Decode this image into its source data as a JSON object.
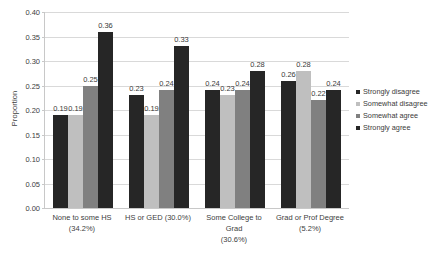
{
  "chart_data": {
    "type": "bar",
    "title": "",
    "xlabel": "",
    "ylabel": "Proportion",
    "ylim": [
      0.0,
      0.4
    ],
    "ytick_step": 0.05,
    "yticks": [
      "0.40",
      "0.35",
      "0.30",
      "0.25",
      "0.20",
      "0.15",
      "0.10",
      "0.05",
      "0.00"
    ],
    "grid": true,
    "legend_position": "right",
    "categories": [
      "None to some HS (34.2%)",
      "HS or GED (30.0%)",
      "Some College to Grad (30.6%)",
      "Grad or Prof Degree (5.2%)"
    ],
    "category_lines": [
      {
        "name": "None to some HS",
        "pct": "(34.2%)"
      },
      {
        "name": "HS or GED (30.0%)",
        "pct": ""
      },
      {
        "name": "Some College to Grad",
        "pct": "(30.6%)"
      },
      {
        "name": "Grad or Prof Degree",
        "pct": "(5.2%)"
      }
    ],
    "series": [
      {
        "name": "Strongly disagree",
        "color": "#262626",
        "values": [
          0.19,
          0.23,
          0.24,
          0.26
        ],
        "labels": [
          "0.19",
          "0.23",
          "0.24",
          "0.26"
        ]
      },
      {
        "name": "Somewhat disagree",
        "color": "#bfbfbf",
        "values": [
          0.19,
          0.19,
          0.23,
          0.28
        ],
        "labels": [
          "0.19",
          "0.19",
          "0.23",
          "0.28"
        ]
      },
      {
        "name": "Somewhat agree",
        "color": "#808080",
        "values": [
          0.25,
          0.24,
          0.24,
          0.22
        ],
        "labels": [
          "0.25",
          "0.24",
          "0.24",
          "0.22"
        ]
      },
      {
        "name": "Strongly agree",
        "color": "#262626",
        "values": [
          0.36,
          0.33,
          0.28,
          0.24
        ],
        "labels": [
          "0.36",
          "0.33",
          "0.28",
          "0.24"
        ]
      }
    ]
  },
  "legend": {
    "items": [
      {
        "label": "Strongly disagree",
        "color": "#262626"
      },
      {
        "label": "Somewhat disagree",
        "color": "#bfbfbf"
      },
      {
        "label": "Somewhat agree",
        "color": "#808080"
      },
      {
        "label": "Strongly agree",
        "color": "#262626"
      }
    ]
  }
}
